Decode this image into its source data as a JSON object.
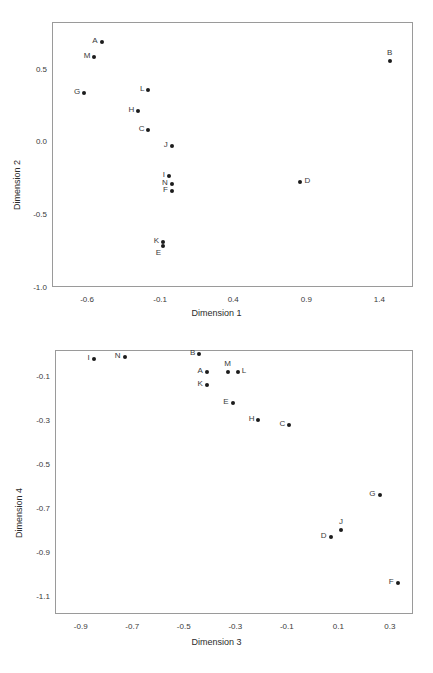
{
  "page": {
    "width": 433,
    "height": 673,
    "background": "#ffffff",
    "point_color": "#1c1c1c",
    "axis_color": "#9a9a9a",
    "text_color": "#2b2b2b",
    "clipped_header_text": ""
  },
  "chart_data": [
    {
      "id": "top",
      "type": "scatter",
      "title": "",
      "xlabel": "Dimension 1",
      "ylabel": "Dimension 2",
      "xlim": [
        -0.84,
        1.63
      ],
      "ylim": [
        -1.0,
        0.82
      ],
      "xticks": [
        -0.6,
        -0.1,
        0.4,
        0.9,
        1.4
      ],
      "xtick_labels": [
        "-0.6",
        "-0.1",
        "0.4",
        "0.9",
        "1.4"
      ],
      "yticks": [
        0.5,
        0.0,
        -0.5,
        -1.0
      ],
      "ytick_labels": [
        "0.5",
        "0.0",
        "-0.5",
        "-1.0"
      ],
      "grid": false,
      "legend": "none",
      "points": [
        {
          "label": "A",
          "x": -0.5,
          "y": 0.68,
          "label_pos": "left"
        },
        {
          "label": "M",
          "x": -0.55,
          "y": 0.58,
          "label_pos": "left"
        },
        {
          "label": "B",
          "x": 1.47,
          "y": 0.55,
          "label_pos": "above"
        },
        {
          "label": "G",
          "x": -0.62,
          "y": 0.33,
          "label_pos": "left"
        },
        {
          "label": "L",
          "x": -0.18,
          "y": 0.35,
          "label_pos": "left"
        },
        {
          "label": "H",
          "x": -0.25,
          "y": 0.21,
          "label_pos": "left"
        },
        {
          "label": "C",
          "x": -0.18,
          "y": 0.08,
          "label_pos": "left"
        },
        {
          "label": "J",
          "x": -0.02,
          "y": -0.03,
          "label_pos": "left"
        },
        {
          "label": "I",
          "x": -0.04,
          "y": -0.24,
          "label_pos": "left"
        },
        {
          "label": "N",
          "x": -0.02,
          "y": -0.29,
          "label_pos": "left"
        },
        {
          "label": "F",
          "x": -0.02,
          "y": -0.34,
          "label_pos": "left"
        },
        {
          "label": "D",
          "x": 0.86,
          "y": -0.28,
          "label_pos": "right"
        },
        {
          "label": "K",
          "x": -0.08,
          "y": -0.69,
          "label_pos": "left"
        },
        {
          "label": "E",
          "x": -0.08,
          "y": -0.72,
          "label_pos": "belowleft"
        }
      ]
    },
    {
      "id": "bottom",
      "type": "scatter",
      "title": "",
      "xlabel": "Dimension 3",
      "ylabel": "Dimension 4",
      "xlim": [
        -1.0,
        0.39
      ],
      "ylim": [
        -1.18,
        0.02
      ],
      "xticks": [
        -0.9,
        -0.7,
        -0.5,
        -0.3,
        -0.1,
        0.1,
        0.3
      ],
      "xtick_labels": [
        "-0.9",
        "-0.7",
        "-0.5",
        "-0.3",
        "-0.1",
        "0.1",
        "0.3"
      ],
      "yticks": [
        -0.1,
        -0.3,
        -0.5,
        -0.7,
        -0.9,
        -1.1
      ],
      "ytick_labels": [
        "-0.1",
        "-0.3",
        "-0.5",
        "-0.7",
        "-0.9",
        "-1.1"
      ],
      "grid": false,
      "legend": "none",
      "points": [
        {
          "label": "I",
          "x": -0.85,
          "y": -0.02,
          "label_pos": "left"
        },
        {
          "label": "N",
          "x": -0.73,
          "y": -0.01,
          "label_pos": "left"
        },
        {
          "label": "B",
          "x": -0.44,
          "y": 0.0,
          "label_pos": "left"
        },
        {
          "label": "A",
          "x": -0.41,
          "y": -0.08,
          "label_pos": "left"
        },
        {
          "label": "M",
          "x": -0.33,
          "y": -0.08,
          "label_pos": "above"
        },
        {
          "label": "L",
          "x": -0.29,
          "y": -0.08,
          "label_pos": "right"
        },
        {
          "label": "K",
          "x": -0.41,
          "y": -0.14,
          "label_pos": "left"
        },
        {
          "label": "E",
          "x": -0.31,
          "y": -0.22,
          "label_pos": "left"
        },
        {
          "label": "H",
          "x": -0.21,
          "y": -0.3,
          "label_pos": "left"
        },
        {
          "label": "C",
          "x": -0.09,
          "y": -0.32,
          "label_pos": "left"
        },
        {
          "label": "G",
          "x": 0.26,
          "y": -0.64,
          "label_pos": "left"
        },
        {
          "label": "J",
          "x": 0.11,
          "y": -0.8,
          "label_pos": "above"
        },
        {
          "label": "D",
          "x": 0.07,
          "y": -0.83,
          "label_pos": "left"
        },
        {
          "label": "F",
          "x": 0.33,
          "y": -1.04,
          "label_pos": "left"
        }
      ]
    }
  ]
}
